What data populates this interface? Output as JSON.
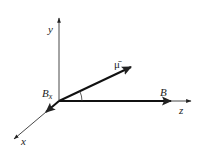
{
  "diagram": {
    "type": "3d-vector-axes",
    "axes": [
      {
        "name": "y",
        "label": "y"
      },
      {
        "name": "z",
        "label": "z"
      },
      {
        "name": "x",
        "label": "x"
      }
    ],
    "vectors": [
      {
        "name": "mu",
        "label": "μ̄"
      },
      {
        "name": "B",
        "label": "B"
      },
      {
        "name": "Bx",
        "label": "B",
        "subscript": "x"
      }
    ],
    "angle": {
      "between": [
        "mu",
        "B"
      ]
    },
    "colors": {
      "line": "#222222",
      "background": "#ffffff"
    }
  }
}
